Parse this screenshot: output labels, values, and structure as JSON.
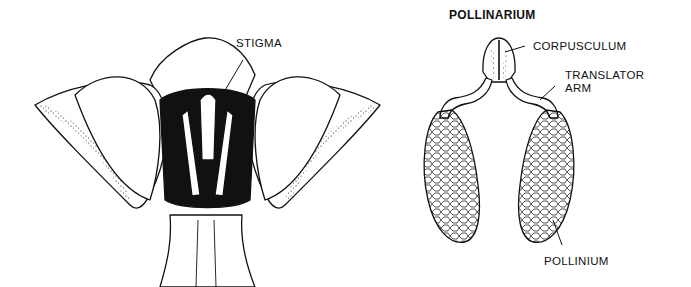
{
  "diagram": {
    "left_figure": {
      "subject": "milkweed flower",
      "labels": {
        "stigma": "STIGMA"
      }
    },
    "right_figure": {
      "title": "POLLINARIUM",
      "labels": {
        "corpusculum": "CORPUSCULUM",
        "translator_arm_line1": "TRANSLATOR",
        "translator_arm_line2": "ARM",
        "pollinium": "POLLINIUM"
      }
    },
    "colors": {
      "ink": "#111111",
      "background": "#ffffff"
    }
  }
}
